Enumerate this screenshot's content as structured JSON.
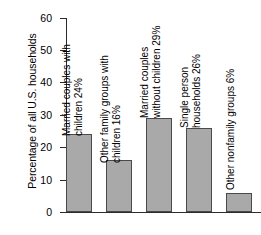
{
  "chart_data": {
    "type": "bar",
    "title": "",
    "xlabel": "",
    "ylabel": "Percentage of all U.S. households",
    "ylim": [
      0,
      60
    ],
    "yticks": [
      0,
      10,
      20,
      30,
      40,
      50,
      60
    ],
    "grid": false,
    "legend": "none",
    "bar_color": "#a9a9a9",
    "bar_edge_color": "#4a4a4a",
    "categories": [
      "Married couples with children",
      "Other family groups with children",
      "Married couples without children",
      "Single person households",
      "Other nonfamily groups"
    ],
    "values": [
      24,
      16,
      29,
      26,
      6
    ],
    "annotations": [
      {
        "line1": "Married couples with",
        "line2": "children 24%"
      },
      {
        "line1": "Other family groups with",
        "line2": "children 16%"
      },
      {
        "line1": "Married couples",
        "line2": "without children 29%"
      },
      {
        "line1": "Single person",
        "line2": "households 26%"
      },
      {
        "line1": "Other nonfamily groups 6%",
        "line2": ""
      }
    ]
  },
  "axis": {
    "y_title": "Percentage of all U.S. households",
    "ticks": [
      "60",
      "50",
      "40",
      "30",
      "20",
      "10",
      "0"
    ]
  }
}
